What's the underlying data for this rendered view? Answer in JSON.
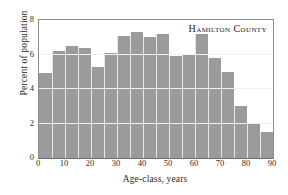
{
  "chart_data": {
    "type": "bar",
    "title": "Hamilton County",
    "xlabel": "Age-class, years",
    "ylabel": "Percent of population",
    "categories": [
      "0-5",
      "5-10",
      "10-15",
      "15-20",
      "20-25",
      "25-30",
      "30-35",
      "35-40",
      "40-45",
      "45-50",
      "50-55",
      "55-60",
      "60-65",
      "65-70",
      "70-75",
      "75-80",
      "80-85",
      "85-90"
    ],
    "x": [
      0,
      5,
      10,
      15,
      20,
      25,
      30,
      35,
      40,
      45,
      50,
      55,
      60,
      65,
      70,
      75,
      80,
      85
    ],
    "bin_width": 5,
    "values": [
      4.9,
      6.2,
      6.5,
      6.4,
      5.3,
      6.1,
      7.1,
      7.3,
      7.0,
      7.2,
      5.9,
      6.0,
      7.2,
      5.8,
      5.0,
      3.0,
      2.0,
      1.5
    ],
    "xlim": [
      0,
      90
    ],
    "ylim": [
      0,
      8
    ],
    "xticks": [
      "0",
      "10",
      "20",
      "30",
      "40",
      "50",
      "60",
      "70",
      "80",
      "90"
    ],
    "xtick_values": [
      0,
      10,
      20,
      30,
      40,
      50,
      60,
      70,
      80,
      90
    ],
    "yticks": [
      "0",
      "2",
      "4",
      "6",
      "8"
    ],
    "ytick_values": [
      0,
      2,
      4,
      6,
      8
    ],
    "gridlines": [
      2,
      4,
      6
    ],
    "grid": true,
    "legend": null,
    "bar_color": "#9b9b9b",
    "grid_color": "#f2f2f2",
    "frame_color": "#8d8d8d",
    "text_color": "#2b2b2b"
  }
}
